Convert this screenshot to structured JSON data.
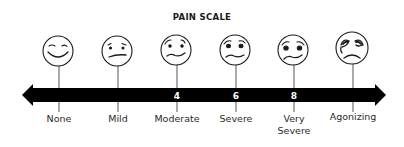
{
  "title": "PAIN SCALE",
  "colors": {
    "ink": "#1a1a1a",
    "bar": "#000000",
    "bar_text": "#ffffff",
    "face_fill": "#ffffff",
    "tick": "#555555"
  },
  "scale": {
    "levels": [
      {
        "label": "None",
        "number": "",
        "face": "smiling-face",
        "x": 59
      },
      {
        "label": "Mild",
        "number": "",
        "face": "uneasy-face",
        "x": 118
      },
      {
        "label": "Moderate",
        "number": "4",
        "face": "worried-face",
        "x": 177
      },
      {
        "label": "Severe",
        "number": "6",
        "face": "distressed-face",
        "x": 236
      },
      {
        "label": "Very Severe",
        "label_line1": "Very",
        "label_line2": "Severe",
        "number": "8",
        "face": "very-distressed-face",
        "x": 294
      },
      {
        "label": "Agonizing",
        "number": "",
        "face": "crying-face",
        "x": 353
      }
    ]
  }
}
